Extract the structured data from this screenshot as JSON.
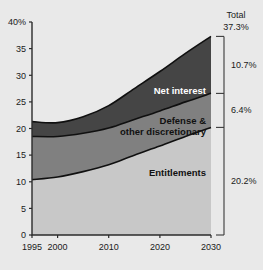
{
  "chart_data": {
    "type": "area",
    "stacked": true,
    "title": "",
    "subtitle": "",
    "xlabel": "",
    "ylabel": "",
    "xlim": [
      1995,
      2030
    ],
    "ylim": [
      0,
      40
    ],
    "ytick_values": [
      0,
      5,
      10,
      15,
      20,
      25,
      30,
      35,
      40
    ],
    "ytick_labels": [
      "0",
      "5",
      "10",
      "15",
      "20",
      "25",
      "30",
      "35",
      "40%"
    ],
    "xtick_values": [
      1995,
      2000,
      2010,
      2020,
      2030
    ],
    "xtick_labels": [
      "1995",
      "2000",
      "2010",
      "2020",
      "2030"
    ],
    "grid": false,
    "legend_position": "inline-area-labels",
    "x": [
      1995,
      2000,
      2005,
      2010,
      2015,
      2020,
      2025,
      2030
    ],
    "series": [
      {
        "name": "Entitlements",
        "label": "Entitlements",
        "color": "#c8c8c8",
        "label_color": "#111111",
        "values": [
          10.4,
          10.9,
          11.9,
          13.2,
          15.0,
          16.7,
          18.5,
          20.2
        ]
      },
      {
        "name": "Defense & other discretionary",
        "label": "Defense & other discretionary",
        "color": "#808080",
        "label_color": "#111111",
        "values": [
          8.1,
          7.6,
          7.2,
          6.9,
          6.7,
          6.6,
          6.5,
          6.4
        ]
      },
      {
        "name": "Net interest",
        "label": "Net interest",
        "color": "#454545",
        "label_color": "#ffffff",
        "values": [
          2.8,
          2.6,
          3.1,
          4.2,
          5.8,
          7.4,
          9.1,
          10.7
        ]
      }
    ],
    "totals": [
      21.3,
      21.1,
      22.2,
      24.3,
      27.5,
      30.7,
      34.1,
      37.3
    ],
    "right_axis": {
      "caption": "Total",
      "total_value": "37.3%",
      "segments": [
        {
          "name": "net-interest",
          "value": "10.7%"
        },
        {
          "name": "defense-other-discretionary",
          "value": "6.4%"
        },
        {
          "name": "entitlements",
          "value": "20.2%"
        }
      ]
    }
  }
}
